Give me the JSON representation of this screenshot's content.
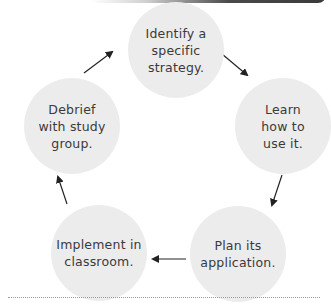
{
  "diagram": {
    "type": "cycle",
    "nodes": [
      {
        "id": "identify",
        "label": "Identify a specific strategy.",
        "lines": [
          "Identify a",
          "specific",
          "strategy."
        ]
      },
      {
        "id": "learn",
        "label": "Learn how to use it.",
        "lines": [
          "Learn",
          "how to",
          "use it."
        ]
      },
      {
        "id": "plan",
        "label": "Plan its application.",
        "lines": [
          "Plan its",
          "application."
        ]
      },
      {
        "id": "implement",
        "label": "Implement in classroom.",
        "lines": [
          "Implement in",
          "classroom."
        ]
      },
      {
        "id": "debrief",
        "label": "Debrief with study group.",
        "lines": [
          "Debrief",
          "with study",
          "group."
        ]
      }
    ],
    "edges": [
      {
        "from": "identify",
        "to": "learn"
      },
      {
        "from": "learn",
        "to": "plan"
      },
      {
        "from": "plan",
        "to": "implement"
      },
      {
        "from": "implement",
        "to": "debrief"
      },
      {
        "from": "debrief",
        "to": "identify"
      }
    ],
    "colors": {
      "node_fill": "#ececec",
      "text": "#3a3a3a",
      "arrow": "#222222",
      "divider": "#9a9a9a"
    }
  }
}
